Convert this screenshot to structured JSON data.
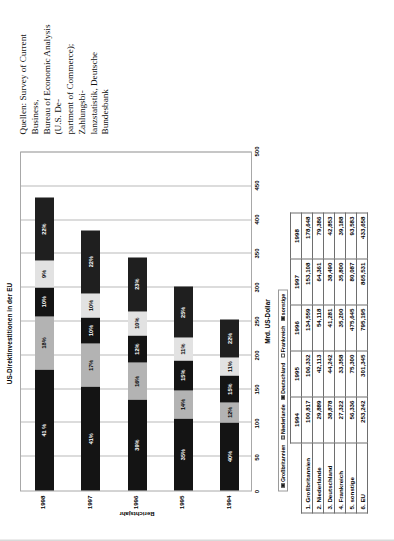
{
  "chart_data": {
    "type": "bar",
    "orientation": "horizontal",
    "stacked": true,
    "title": "US-Direktinvestitionen in der EU",
    "xlabel": "Mrd. US-Dollar",
    "ylabel": "Berichtsjahr",
    "xlim": [
      0,
      500
    ],
    "xticks": [
      0,
      50,
      100,
      150,
      200,
      250,
      300,
      350,
      400,
      450,
      500
    ],
    "grid": true,
    "legend_position": "bottom-left",
    "categories": [
      "1994",
      "1995",
      "1996",
      "1997",
      "1998"
    ],
    "series": [
      {
        "name": "Großbritannien",
        "color": "#141414",
        "values": [
          100.817,
          106.332,
          134.559,
          153.108,
          178.648
        ]
      },
      {
        "name": "Niederlande",
        "color": "#b3b3b3",
        "values": [
          29.889,
          42.113,
          54.118,
          64.361,
          79.386
        ]
      },
      {
        "name": "Deutschland",
        "color": "#141414",
        "values": [
          38.878,
          44.242,
          41.281,
          38.49,
          42.853
        ]
      },
      {
        "name": "Frankreich",
        "color": "#e2e2e2",
        "values": [
          27.322,
          33.358,
          35.2,
          35.8,
          39.188
        ]
      },
      {
        "name": "sonstige",
        "color": "#1f1f1f",
        "values": [
          56.336,
          75.3,
          80.087,
          93.583,
          93.583
        ]
      }
    ],
    "bar_labels": {
      "1994": [
        "40%",
        "12%",
        "15%",
        "11%",
        "22%"
      ],
      "1995": [
        "35%",
        "14%",
        "15%",
        "11%",
        "25%"
      ],
      "1996": [
        "39%",
        "16%",
        "12%",
        "10%",
        "23%"
      ],
      "1997": [
        "41%",
        "17%",
        "10%",
        "10%",
        "22%"
      ],
      "1998": [
        "41 %",
        "18%",
        "10%",
        "9%",
        "22%"
      ]
    }
  },
  "chart": {
    "title": "US-Direktinvestitionen in der EU",
    "y_axis_title": "Berichtsjahr",
    "x_axis_unit": "Mrd. US-Dollar",
    "x_ticks": [
      "0",
      "50",
      "100",
      "150",
      "200",
      "250",
      "300",
      "350",
      "400",
      "450",
      "500"
    ],
    "legend": [
      {
        "label": "Großbritannien",
        "swatch": "dark"
      },
      {
        "label": "Niederlande",
        "swatch": "light"
      },
      {
        "label": "Deutschland",
        "swatch": "dark"
      },
      {
        "label": "Frankreich",
        "swatch": "white"
      },
      {
        "label": "sonstige",
        "swatch": "dark"
      }
    ],
    "categories": [
      "1998",
      "1997",
      "1996",
      "1995",
      "1994"
    ]
  },
  "table": {
    "years": [
      "1994",
      "1995",
      "1996",
      "1997",
      "1998"
    ],
    "rows": [
      {
        "label": "1. Großbritannien",
        "values": [
          "100,817",
          "106,332",
          "134,559",
          "153,108",
          "178,648"
        ]
      },
      {
        "label": "2. Niederlande",
        "values": [
          "29,889",
          "42,113",
          "54,118",
          "64,361",
          "79,386"
        ]
      },
      {
        "label": "3. Deutschland",
        "values": [
          "38,878",
          "44,242",
          "41,281",
          "38,490",
          "42,853"
        ]
      },
      {
        "label": "4. Frankreich",
        "values": [
          "27,322",
          "33,358",
          "35,200",
          "35,800",
          "39,188"
        ]
      },
      {
        "label": "5. sonstige",
        "values": [
          "56,336",
          "75,300",
          "475,645",
          "80,087",
          "93,583"
        ]
      },
      {
        "label": "6. EU",
        "values": [
          "253,242",
          "301,345",
          "795,195",
          "865,531",
          "433,658"
        ]
      }
    ]
  },
  "source": {
    "lines": [
      "Quellen: Survey of Current Business,",
      "Bureau of Economic Analysis (U.S. De-",
      "partment of Commerce); Zahlungsbi-",
      "lanzstatistik, Deutsche Bundesbank"
    ]
  }
}
